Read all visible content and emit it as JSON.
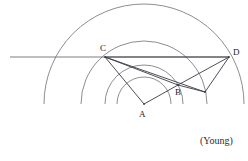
{
  "figure": {
    "type": "geometric-construction-diagram",
    "attribution": "(Young)",
    "stroke_color": "#6e6e78",
    "ray_color": "#3a3a44",
    "background": "#ffffff",
    "labels": {
      "a": "A",
      "b": "B",
      "c": "C",
      "d": "D"
    },
    "points": {
      "A": {
        "x": 144,
        "y": 104
      },
      "B": {
        "x": 178,
        "y": 85
      },
      "C": {
        "x": 105,
        "y": 57
      },
      "D": {
        "x": 229,
        "y": 57
      },
      "E": {
        "x": 205,
        "y": 92
      }
    },
    "label_positions": {
      "A": {
        "x": 139,
        "y": 110
      },
      "B": {
        "x": 175,
        "y": 88
      },
      "C": {
        "x": 100,
        "y": 44
      },
      "D": {
        "x": 233,
        "y": 48
      }
    },
    "arcs": {
      "center": {
        "x": 144,
        "y": 104
      },
      "radii": [
        100,
        63,
        39,
        27
      ],
      "start_angle_deg": 180,
      "end_angle_deg": 360
    },
    "horizontal_line": {
      "x1": 10,
      "y1": 57,
      "x2": 229,
      "y2": 57
    },
    "segments": [
      {
        "name": "C-A",
        "x1": 105,
        "y1": 57,
        "x2": 144,
        "y2": 104
      },
      {
        "name": "A-B",
        "x1": 144,
        "y1": 104,
        "x2": 178,
        "y2": 85
      },
      {
        "name": "C-B",
        "x1": 105,
        "y1": 57,
        "x2": 178,
        "y2": 85
      },
      {
        "name": "C-E",
        "x1": 105,
        "y1": 57,
        "x2": 205,
        "y2": 92
      },
      {
        "name": "C-D",
        "x1": 105,
        "y1": 57,
        "x2": 229,
        "y2": 57
      },
      {
        "name": "B-D",
        "x1": 178,
        "y1": 85,
        "x2": 229,
        "y2": 57
      },
      {
        "name": "E-D",
        "x1": 205,
        "y1": 92,
        "x2": 229,
        "y2": 57
      },
      {
        "name": "B-E",
        "x1": 178,
        "y1": 85,
        "x2": 205,
        "y2": 92
      }
    ],
    "attribution_position": {
      "x": 200,
      "y": 136
    }
  }
}
